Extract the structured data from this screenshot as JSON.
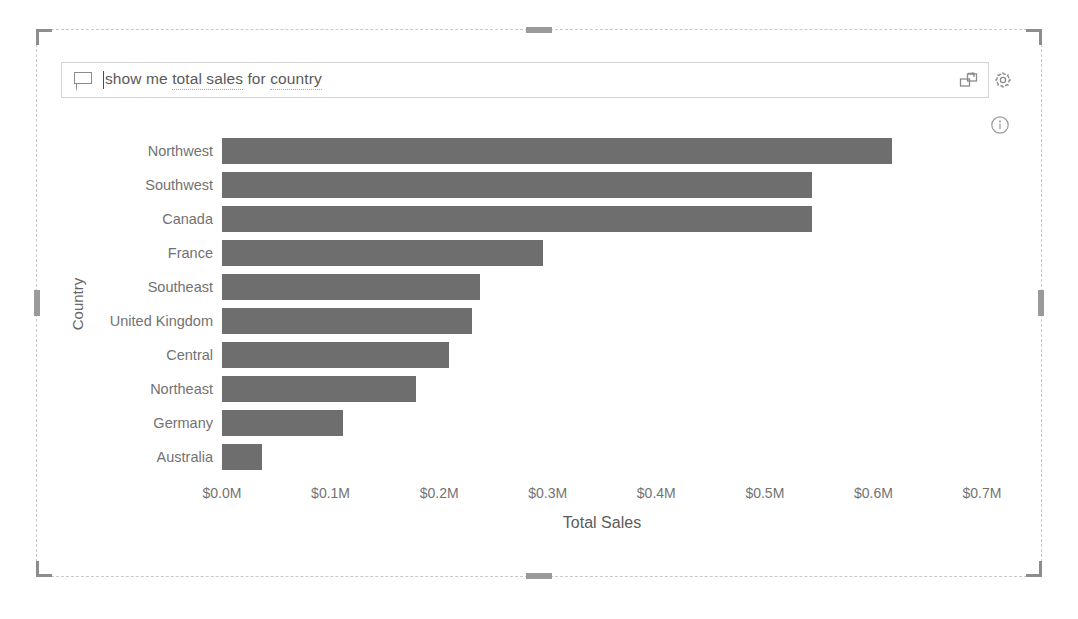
{
  "qna": {
    "chat_icon": "speech-bubble-icon",
    "query_value": "show me total sales for country",
    "query_placeholder": "Ask a question about your data",
    "query_tokens": [
      {
        "text": "show me ",
        "entity": false
      },
      {
        "text": "total sales",
        "entity": true
      },
      {
        "text": " for ",
        "entity": false
      },
      {
        "text": "country",
        "entity": true
      }
    ]
  },
  "toolbar": {
    "convert_label": "convert-to-visual-icon",
    "settings_label": "gear-icon",
    "info_label": "info-icon"
  },
  "colors": {
    "bar": "#6e6e6e",
    "text": "#6e6e6e",
    "frame": "#c9c9c9",
    "handle": "#8d8d8d"
  },
  "chart_data": {
    "type": "bar",
    "orientation": "horizontal",
    "title": "",
    "xlabel": "Total Sales",
    "ylabel": "Country",
    "categories": [
      "Northwest",
      "Southwest",
      "Canada",
      "France",
      "Southeast",
      "United Kingdom",
      "Central",
      "Northeast",
      "Germany",
      "Australia"
    ],
    "values": [
      0.617,
      0.543,
      0.543,
      0.296,
      0.238,
      0.23,
      0.209,
      0.179,
      0.111,
      0.037
    ],
    "value_unit": "millions of dollars",
    "xlim": [
      0.0,
      0.7
    ],
    "xticks": [
      0.0,
      0.1,
      0.2,
      0.3,
      0.4,
      0.5,
      0.6,
      0.7
    ],
    "xticklabels": [
      "$0.0M",
      "$0.1M",
      "$0.2M",
      "$0.3M",
      "$0.4M",
      "$0.5M",
      "$0.6M",
      "$0.7M"
    ],
    "grid": false,
    "legend": false,
    "bar_color": "#6e6e6e"
  }
}
